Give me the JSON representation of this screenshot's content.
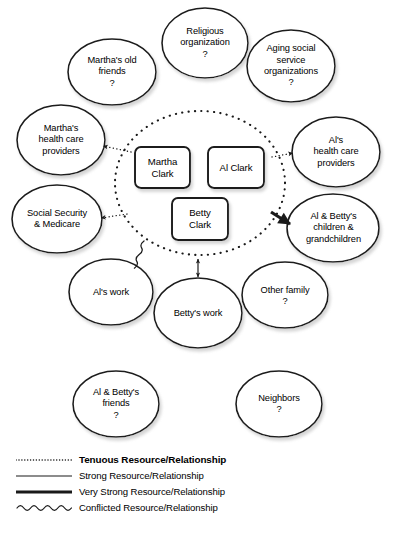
{
  "diagram": {
    "type": "ecomap",
    "center_circle": {
      "name": "family-household-circle",
      "style": "dotted",
      "members": [
        {
          "id": "martha",
          "label": "Martha\nClark"
        },
        {
          "id": "al",
          "label": "Al Clark"
        },
        {
          "id": "betty",
          "label": "Betty\nClark"
        }
      ]
    },
    "nodes": [
      {
        "id": "marthas-old-friends",
        "label": "Martha's old\nfriends",
        "marker": "?",
        "cx": 112,
        "cy": 72,
        "rx": 44,
        "ry": 33
      },
      {
        "id": "religious-organization",
        "label": "Religious\norganization",
        "marker": "?",
        "cx": 205,
        "cy": 43,
        "rx": 43,
        "ry": 35
      },
      {
        "id": "aging-social-service-organizations",
        "label": "Aging social\nservice\norganizations",
        "marker": "?",
        "cx": 291,
        "cy": 66,
        "rx": 44,
        "ry": 36
      },
      {
        "id": "marthas-health-care-providers",
        "label": "Martha's\nhealth care\nproviders",
        "marker": "",
        "cx": 61,
        "cy": 140,
        "rx": 44,
        "ry": 35
      },
      {
        "id": "als-health-care-providers",
        "label": "Al's\nhealth care\nproviders",
        "marker": "",
        "cx": 336,
        "cy": 152,
        "rx": 44,
        "ry": 35
      },
      {
        "id": "social-security-medicare",
        "label": "Social Security\n& Medicare",
        "marker": "",
        "cx": 57,
        "cy": 219,
        "rx": 45,
        "ry": 34
      },
      {
        "id": "al-bettys-children-grandchildren",
        "label": "Al & Betty's\nchildren &\ngrandchildren",
        "marker": "",
        "cx": 333,
        "cy": 228,
        "rx": 46,
        "ry": 34
      },
      {
        "id": "als-work",
        "label": "Al's work",
        "marker": "",
        "cx": 111,
        "cy": 292,
        "rx": 42,
        "ry": 33
      },
      {
        "id": "bettys-work",
        "label": "Betty's work",
        "marker": "",
        "cx": 198,
        "cy": 313,
        "rx": 44,
        "ry": 35
      },
      {
        "id": "other-family",
        "label": "Other family",
        "marker": "?",
        "cx": 285,
        "cy": 295,
        "rx": 43,
        "ry": 33
      },
      {
        "id": "al-bettys-friends",
        "label": "Al & Betty's\nfriends",
        "marker": "?",
        "cx": 116,
        "cy": 404,
        "rx": 43,
        "ry": 33
      },
      {
        "id": "neighbors",
        "label": "Neighbors",
        "marker": "?",
        "cx": 279,
        "cy": 404,
        "rx": 43,
        "ry": 33
      }
    ],
    "connections": [
      {
        "from": "family-household-circle",
        "to": "marthas-health-care-providers",
        "strength": "tenuous",
        "arrow": "single"
      },
      {
        "from": "family-household-circle",
        "to": "social-security-medicare",
        "strength": "tenuous",
        "arrow": "single"
      },
      {
        "from": "family-household-circle",
        "to": "als-health-care-providers",
        "strength": "tenuous",
        "arrow": "single"
      },
      {
        "from": "family-household-circle",
        "to": "al-bettys-children-grandchildren",
        "strength": "very-strong",
        "arrow": "single"
      },
      {
        "from": "family-household-circle",
        "to": "bettys-work",
        "strength": "strong",
        "arrow": "double"
      },
      {
        "from": "family-household-circle",
        "to": "als-work",
        "strength": "conflicted",
        "arrow": "none"
      }
    ]
  },
  "legend": {
    "name": "relationship-legend",
    "items": [
      {
        "style": "dotted",
        "label": "Tenuous Resource/Relationship",
        "bold": true
      },
      {
        "style": "thin",
        "label": "Strong Resource/Relationship",
        "bold": false
      },
      {
        "style": "thick",
        "label": "Very Strong Resource/Relationship",
        "bold": false
      },
      {
        "style": "wavy",
        "label": "Conflicted Resource/Relationship",
        "bold": false
      }
    ]
  },
  "colors": {
    "ink": "#1a1a1a",
    "background": "#ffffff",
    "shadow": "#b9b9b9"
  }
}
